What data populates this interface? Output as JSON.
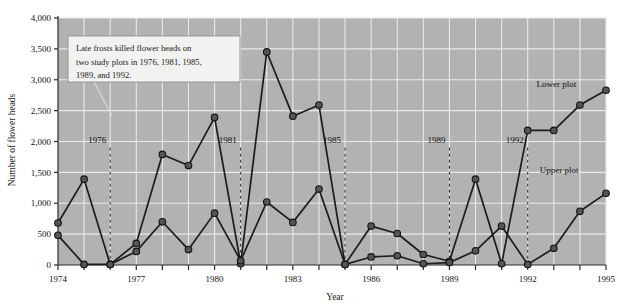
{
  "chart_data": {
    "type": "line",
    "title": "",
    "xlabel": "Year",
    "ylabel": "Number of flower heads",
    "xlim": [
      1974,
      1995
    ],
    "ylim": [
      0,
      4000
    ],
    "xticks": [
      1974,
      1975,
      1976,
      1977,
      1978,
      1979,
      1980,
      1981,
      1982,
      1983,
      1984,
      1985,
      1986,
      1987,
      1988,
      1989,
      1990,
      1991,
      1992,
      1993,
      1994,
      1995
    ],
    "xticklabels_shown": [
      "1974",
      "1977",
      "1980",
      "1983",
      "1986",
      "1989",
      "1992",
      "1995"
    ],
    "yticks": [
      0,
      500,
      1000,
      1500,
      2000,
      2500,
      3000,
      3500,
      4000
    ],
    "yticklabels": [
      "0",
      "500",
      "1,000",
      "1,500",
      "2,000",
      "2,500",
      "3,000",
      "3,500",
      "4,000"
    ],
    "grid": true,
    "legend_position": "inline-labels",
    "x": [
      1974,
      1975,
      1976,
      1977,
      1978,
      1979,
      1980,
      1981,
      1982,
      1983,
      1984,
      1985,
      1986,
      1987,
      1988,
      1989,
      1990,
      1991,
      1992,
      1993,
      1994,
      1995
    ],
    "series": [
      {
        "name": "Lower plot",
        "label_x": 1993.1,
        "label_y": 2880,
        "values": [
          680,
          1390,
          10,
          350,
          1790,
          1610,
          2390,
          20,
          3450,
          2410,
          2590,
          10,
          630,
          510,
          170,
          60,
          1390,
          20,
          2180,
          2180,
          2590,
          2830
        ]
      },
      {
        "name": "Upper plot",
        "label_x": 1993.2,
        "label_y": 1490,
        "values": [
          480,
          10,
          10,
          220,
          700,
          250,
          840,
          70,
          1020,
          690,
          1230,
          10,
          130,
          150,
          20,
          40,
          230,
          630,
          10,
          270,
          870,
          1160
        ]
      }
    ],
    "event_markers": [
      {
        "year": 1976,
        "label": "1976"
      },
      {
        "year": 1981,
        "label": "1981"
      },
      {
        "year": 1985,
        "label": "1985"
      },
      {
        "year": 1989,
        "label": "1989"
      },
      {
        "year": 1992,
        "label": "1992"
      }
    ],
    "annotation": {
      "lines": [
        "Late frosts killed flower heads on",
        "two study plots in 1976, 1981, 1985,",
        "1989, and 1992."
      ],
      "pointer_target_year": 1976
    },
    "colors": {
      "plot_background": "#b2b2b2",
      "grid": "#e9e9e9",
      "line": "#1c1c1c",
      "marker_fill": "#555555",
      "marker_stroke": "#141414",
      "axis": "#2a2a2a",
      "page_background": "#ffffff",
      "note_background": "#f2f2f0",
      "note_border": "#8a8a8a"
    }
  }
}
